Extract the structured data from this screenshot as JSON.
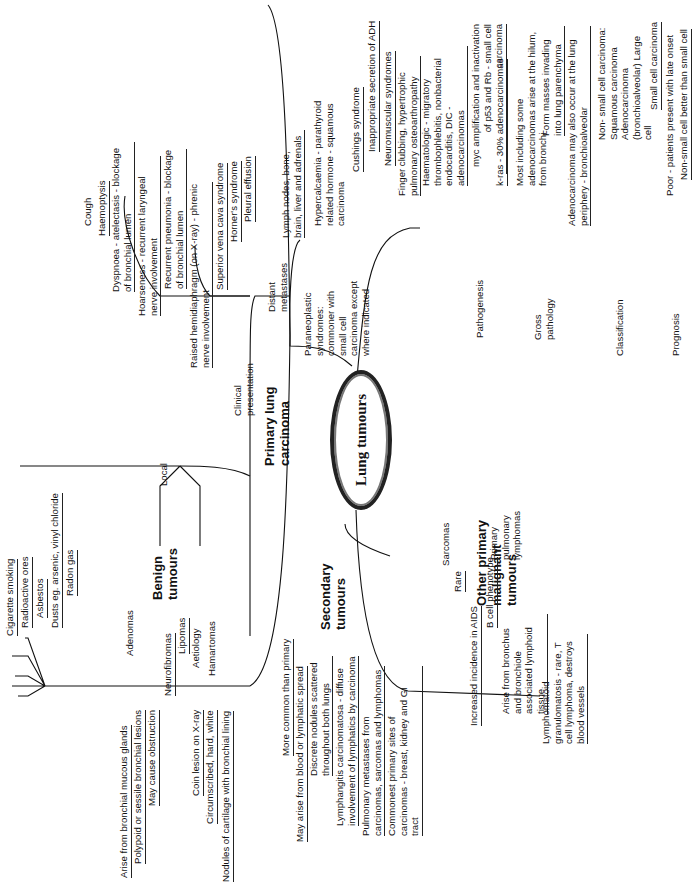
{
  "center": {
    "label": "Lung tumours"
  },
  "primary": {
    "label": "Primary lung carcinoma",
    "aetiology": {
      "label": "Aetiology",
      "items": [
        "Cigarette smoking",
        "Radioactive ores",
        "Asbestos",
        "Dusts eg. arsenic, vinyl chloride",
        "Radon gas"
      ]
    },
    "clinical": {
      "label": "Clinical presentation",
      "local": {
        "label": "Local",
        "items": [
          "Cough",
          "Haemoptysis",
          "Dyspnoea - atelectasis - blockage of bronchial lumen",
          "Hoarseness - recurrent laryngeal nerve involvement",
          "Recurrent pneumonia - blockage of bronchial lumen",
          "Raised hemidiaphragm (on X-ray) - phrenic nerve involvement",
          "Superior vena cava syndrome",
          "Horner's syndrome",
          "Pleural effusion"
        ]
      },
      "distant": {
        "label": "Distant metastases",
        "items": [
          "Lymph nodes, bone, brain, liver and adrenals"
        ]
      },
      "paraneoplastic": {
        "label": "Paraneoplastic syndromes: commoner with small cell carcinoma except where indicated",
        "items": [
          "Hypercalcaemia - parathyroid related hormone - squamous carcinoma",
          "Cushings syndrome",
          "Inappropriate secretion of ADH",
          "Neuromuscular syndromes",
          "Finger clubbing, hypertrophic pulmonary osteoarthropathy",
          "Haematologic - migratory thrombophlebitis, nonbacterial endocarditis, DIC - adenocarcinomas"
        ]
      }
    },
    "pathogenesis": {
      "label": "Pathogenesis",
      "items": [
        "myc amplification and inactivation of p53 and Rb - small cell carcinoma",
        "k-ras - 30% adenocarcinomas"
      ]
    },
    "gross": {
      "label": "Gross pathology",
      "items": [
        "Most including some adenocarcinomas arise at the hilum, from bronchi",
        "Form masses invading into lung parenchyma",
        "Adenocarcinoma may also occur at the lung periphery - bronchioalveolar"
      ]
    },
    "classification": {
      "label": "Classification",
      "items": [
        "Non- small cell carcinoma: Squamous carcinoma Adenocarcinoma (bronchioalveolar) Large cell",
        "Small cell carcinoma"
      ]
    },
    "prognosis": {
      "label": "Prognosis",
      "items": [
        "Poor - patients present with late onset",
        "Non-small cell better than small cell"
      ]
    }
  },
  "benign": {
    "label": "Benign tumours",
    "adenomas": {
      "label": "Adenomas",
      "items": [
        "Arise from bronchial mucous glands",
        "Polypoid or sessile bronchial lesions",
        "May cause obstruction"
      ]
    },
    "neurofibromas": {
      "label": "Neurofibromas"
    },
    "lipomas": {
      "label": "Lipomas"
    },
    "hamartomas": {
      "label": "Hamartomas",
      "items": [
        "Coin lesion on X-ray",
        "Circumscribed, hard, white",
        "Nodules of cartilage with bronchial lining"
      ]
    }
  },
  "secondary": {
    "label": "Secondary tumours",
    "items": [
      "More common than primary",
      "May arise from blood or lymphatic spread",
      "Discrete nodules scattered throughout both lungs",
      "Lymphangitis carcinomatosa - diffuse involvement of lymphatics by carcinoma",
      "Pulmonary metastases from carcinomas, sarcomas and lymphomas",
      "Commonest primary sites of carcinomas - breast, kidney and GI tract"
    ]
  },
  "other": {
    "label": "Other primary malignant tumours",
    "sarcomas": {
      "label": "Sarcomas",
      "items": [
        "Rare"
      ]
    },
    "lymphomas": {
      "label": "Primary pulmonary lymphomas",
      "items": [
        "Increased incidence in AIDS",
        "B cell phenotype",
        "Arise from bronchus and bronchiole associated lymphoid tissue",
        "Lymphomatoid granulomatosis - rare, T cell lymphoma, destroys blood vessels"
      ]
    }
  }
}
